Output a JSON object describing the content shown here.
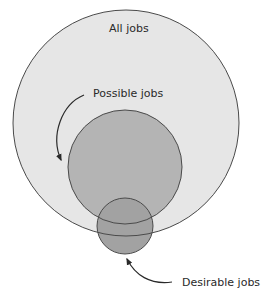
{
  "diagram": {
    "type": "nested-venn",
    "sets": [
      {
        "id": "all",
        "label": "All jobs",
        "fill": "#e6e6e6",
        "stroke": "#4a4a4a"
      },
      {
        "id": "possible",
        "label": "Possible jobs",
        "fill": "#b4b4b4",
        "stroke": "#4a4a4a"
      },
      {
        "id": "desirable",
        "label": "Desirable jobs",
        "fill": "#a2a2a2",
        "stroke": "#4a4a4a"
      }
    ],
    "labels": {
      "all": "All jobs",
      "possible": "Possible jobs",
      "desirable": "Desirable jobs"
    }
  }
}
